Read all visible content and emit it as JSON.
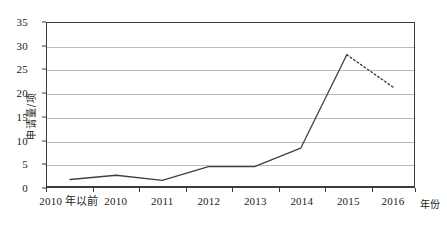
{
  "chart_data": {
    "type": "line",
    "title": "",
    "xlabel": "年份",
    "ylabel": "申请量/项",
    "categories": [
      "2010 年以前",
      "2010",
      "2011",
      "2012",
      "2013",
      "2014",
      "2015",
      "2016"
    ],
    "values": [
      2.0,
      2.9,
      1.8,
      4.7,
      4.7,
      8.6,
      28.3,
      21.5
    ],
    "series": [
      {
        "name": "申请量",
        "values": [
          2.0,
          2.9,
          1.8,
          4.7,
          4.7,
          8.6,
          28.3,
          21.5
        ],
        "line_style_by_segment": [
          "solid",
          "solid",
          "solid",
          "solid",
          "solid",
          "solid",
          "dotted"
        ],
        "color": "#404040"
      }
    ],
    "ylim": [
      0,
      35
    ],
    "yticks": [
      "0",
      "5",
      "10",
      "15",
      "20",
      "25",
      "30",
      "35"
    ],
    "ytick_values": [
      0,
      5,
      10,
      15,
      20,
      25,
      30,
      35
    ],
    "grid": "horizontal",
    "legend": "none",
    "markers": "none",
    "gridline_color": "#b9b9b9",
    "axis_color": "#3a3a3a"
  },
  "axes": {
    "y_title": "申请量/项",
    "x_title": "年份"
  }
}
